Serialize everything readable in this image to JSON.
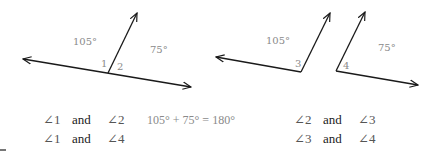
{
  "figure_left": {
    "angle_labels": {
      "left_measure": "105°",
      "right_measure": "75°",
      "angle_1": "1",
      "angle_2": "2"
    }
  },
  "figure_right": {
    "angle_labels": {
      "left_measure": "105°",
      "right_measure": "75°",
      "angle_3": "3",
      "angle_4": "4"
    }
  },
  "statements": {
    "left": [
      {
        "a": "∠1",
        "conj": "and",
        "b": "∠2"
      },
      {
        "a": "∠1",
        "conj": "and",
        "b": "∠4"
      }
    ],
    "equation": "105° + 75° = 180°",
    "right": [
      {
        "a": "∠2",
        "conj": "and",
        "b": "∠3"
      },
      {
        "a": "∠3",
        "conj": "and",
        "b": "∠4"
      }
    ]
  },
  "colors": {
    "line": "#1a1a1a",
    "label": "#8a8a8a",
    "text": "#222222"
  }
}
